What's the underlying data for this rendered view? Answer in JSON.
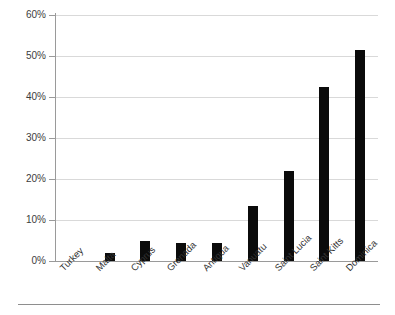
{
  "chart_data": {
    "type": "bar",
    "title": "",
    "subtitle": "",
    "xlabel": "",
    "ylabel": "",
    "categories": [
      "Turkey",
      "Malta",
      "Cyprus",
      "Grenada",
      "Antigua",
      "Vanuatu",
      "Saint Lucia",
      "Saint Kitts",
      "Dominica"
    ],
    "values": [
      0,
      2,
      5,
      4.5,
      4.5,
      13.5,
      22,
      42.5,
      51.5
    ],
    "value_format": "percent",
    "ylim": [
      0,
      60
    ],
    "ytick_values": [
      0,
      10,
      20,
      30,
      40,
      50,
      60
    ],
    "ytick_labels": [
      "0%",
      "10%",
      "20%",
      "30%",
      "40%",
      "50%",
      "60%"
    ],
    "grid": true,
    "legend": false,
    "legend_position": "none",
    "bar_color": "#0b0b0b",
    "gridline_color": "#d9d9d9",
    "axis_color": "#9a9a9a",
    "tick_label_color": "#333333"
  }
}
